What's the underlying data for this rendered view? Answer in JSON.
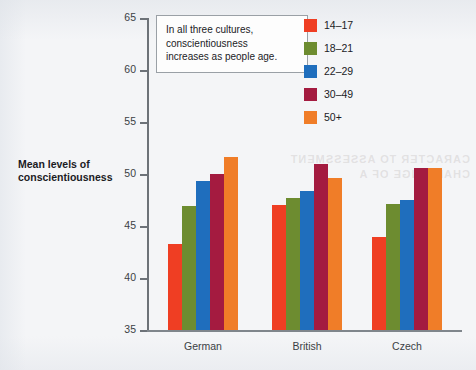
{
  "chart_data": {
    "type": "bar",
    "title": "",
    "xlabel": "",
    "ylabel": "Mean levels of conscientiousness",
    "ylim": [
      35,
      65
    ],
    "ytick_step": 5,
    "yticks": [
      65,
      60,
      55,
      50,
      45,
      40,
      35
    ],
    "grid": false,
    "legend_position": "top-right",
    "categories": [
      "German",
      "British",
      "Czech"
    ],
    "series": [
      {
        "name": "14–17",
        "color": "#ef3e23",
        "values": [
          43.3,
          47.0,
          43.9
        ]
      },
      {
        "name": "18–21",
        "color": "#6d8c30",
        "values": [
          46.9,
          47.7,
          47.1
        ]
      },
      {
        "name": "22–29",
        "color": "#1f6ebd",
        "values": [
          49.3,
          48.4,
          47.5
        ]
      },
      {
        "name": "30–49",
        "color": "#a41b40",
        "values": [
          50.0,
          51.0,
          50.6
        ]
      },
      {
        "name": "50+",
        "color": "#f07d28",
        "values": [
          51.6,
          49.6,
          50.6
        ]
      }
    ],
    "annotation": "In all three cultures, conscientiousness increases as people age."
  },
  "axis": {
    "y_title_line1": "Mean levels of",
    "y_title_line2": "conscientiousness"
  },
  "annotation": {
    "line1": "In all three cultures,",
    "line2": "conscientiousness",
    "line3": "increases as people age."
  },
  "background": {
    "ghost_line1": "CARACTER TO ASSESSMENT",
    "ghost_line2": "CHALLENGE OF A"
  }
}
